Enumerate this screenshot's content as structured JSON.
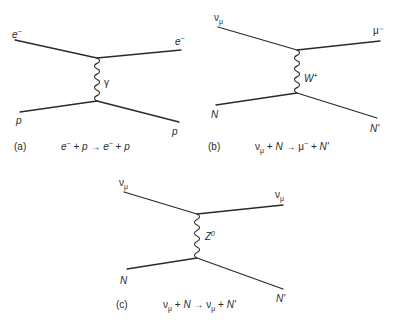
{
  "diagrams": [
    {
      "id": "a",
      "caption_tag": "(a)",
      "equation": "e⁻ + p → e⁻ + p",
      "labels": {
        "in_top": "e⁻",
        "out_top": "e⁻",
        "in_bottom": "p",
        "out_bottom": "p",
        "boson": "γ"
      }
    },
    {
      "id": "b",
      "caption_tag": "(b)",
      "equation": "νμ + N → μ⁻ + N'",
      "labels": {
        "in_top": "ν",
        "in_top_sub": "μ",
        "out_top": "μ⁻",
        "in_bottom": "N",
        "out_bottom": "N'",
        "boson": "W",
        "boson_sup": "+"
      }
    },
    {
      "id": "c",
      "caption_tag": "(c)",
      "equation": "νμ + N → νμ + N'",
      "labels": {
        "in_top": "ν",
        "in_top_sub": "μ",
        "out_top": "ν",
        "out_top_sub": "μ",
        "in_bottom": "N",
        "out_bottom": "N'",
        "boson": "Z",
        "boson_sup": "0"
      }
    }
  ],
  "equations": {
    "a": {
      "lhs1": "e",
      "lhs1_sup": "−",
      "plus1": " + ",
      "lhs2": "p",
      "arrow": " → ",
      "rhs1": "e",
      "rhs1_sup": "−",
      "plus2": " + ",
      "rhs2": "p"
    },
    "b": {
      "lhs1": "ν",
      "lhs1_sub": "μ",
      "plus1": " + ",
      "lhs2": "N",
      "arrow": " → ",
      "rhs1": "μ",
      "rhs1_sup": "−",
      "plus2": " + ",
      "rhs2": "N'"
    },
    "c": {
      "lhs1": "ν",
      "lhs1_sub": "μ",
      "plus1": " + ",
      "lhs2": "N",
      "arrow": " → ",
      "rhs1": "ν",
      "rhs1_sub": "μ",
      "plus2": " + ",
      "rhs2": "N'"
    }
  },
  "colors": {
    "ink": "#2a2a2a",
    "background": "#ffffff"
  }
}
